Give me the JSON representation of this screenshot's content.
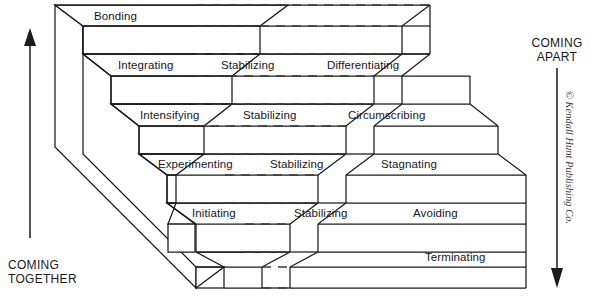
{
  "figure": {
    "background_color": "#ffffff",
    "line_color": "#1b1b1b",
    "dash_color": "#3a3a3a"
  },
  "axes": {
    "left": {
      "label": "COMING\nTOGETHER",
      "direction": "up",
      "arrow_name": "coming-together-arrow"
    },
    "right": {
      "label": "COMING\nAPART",
      "direction": "down",
      "arrow_name": "coming-apart-arrow"
    }
  },
  "stages": {
    "coming_together": [
      {
        "label": "Bonding",
        "level": 5
      },
      {
        "label": "Integrating",
        "level": 4
      },
      {
        "label": "Intensifying",
        "level": 3
      },
      {
        "label": "Experimenting",
        "level": 2
      },
      {
        "label": "Initiating",
        "level": 1
      }
    ],
    "stabilizing": [
      {
        "label": "Stabilizing",
        "level": 4
      },
      {
        "label": "Stabilizing",
        "level": 3
      },
      {
        "label": "Stabilizing",
        "level": 2
      },
      {
        "label": "Stabilizing",
        "level": 1
      }
    ],
    "coming_apart": [
      {
        "label": "Differentiating",
        "level": 4
      },
      {
        "label": "Circumscribing",
        "level": 3
      },
      {
        "label": "Stagnating",
        "level": 2
      },
      {
        "label": "Avoiding",
        "level": 1
      },
      {
        "label": "Terminating",
        "level": 0
      }
    ]
  },
  "credit": {
    "text": "© Kendall Hunt Publishing Co."
  }
}
